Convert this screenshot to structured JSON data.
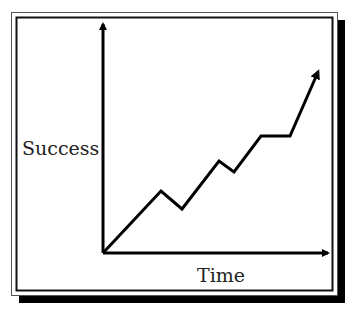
{
  "chart_data": {
    "type": "line",
    "title": "",
    "xlabel": "Time",
    "ylabel": "Success",
    "grid": false,
    "legend": null,
    "axis_ticks": false,
    "series": [
      {
        "name": "Success over time",
        "points_px": [
          [
            103,
            253
          ],
          [
            161,
            191
          ],
          [
            182,
            209
          ],
          [
            219,
            161
          ],
          [
            234,
            172
          ],
          [
            261,
            136
          ],
          [
            290,
            136
          ],
          [
            318,
            72
          ]
        ],
        "relative_values": [
          0,
          27,
          19,
          40,
          35,
          51,
          51,
          79
        ],
        "ends_with_arrow": true
      }
    ]
  },
  "labels": {
    "y_axis": "Success",
    "x_axis": "Time"
  },
  "colors": {
    "line": "#000000",
    "background": "#ffffff",
    "shadow": "#000000"
  }
}
